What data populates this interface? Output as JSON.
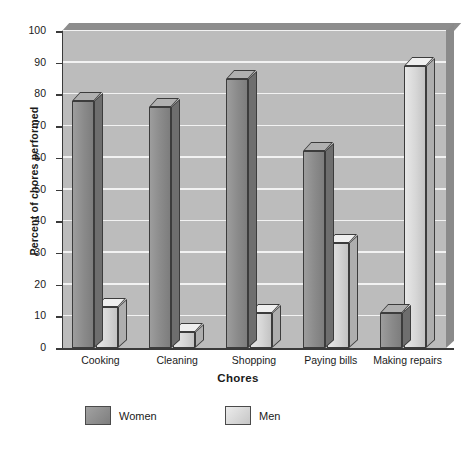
{
  "chart_data": {
    "type": "bar",
    "title": "",
    "xlabel": "Chores",
    "ylabel": "Percent of chores performed",
    "categories": [
      "Cooking",
      "Cleaning",
      "Shopping",
      "Paying bills",
      "Making repairs"
    ],
    "series": [
      {
        "name": "Women",
        "values": [
          78,
          76,
          85,
          62,
          11
        ],
        "color": "#8a8a8a"
      },
      {
        "name": "Men",
        "values": [
          13,
          5,
          11,
          33,
          89
        ],
        "color": "#d6d6d6"
      }
    ],
    "ylim": [
      0,
      100
    ],
    "yticks": [
      0,
      10,
      20,
      30,
      40,
      50,
      60,
      70,
      80,
      90,
      100
    ],
    "ytick_labels": [
      "0",
      "10",
      "20",
      "30",
      "40",
      "50",
      "60",
      "70",
      "80",
      "90",
      "100"
    ],
    "grid": true,
    "grid_color": "#f2f2f2",
    "plot_background": "#bcbcbc",
    "legend_position": "bottom",
    "style": "3d-bars-grayscale"
  },
  "legend": {
    "items": [
      {
        "label": "Women",
        "swatch": "women-swatch"
      },
      {
        "label": "Men",
        "swatch": "men-swatch"
      }
    ]
  },
  "axis": {
    "y_title": "Percent of chores performed",
    "x_title": "Chores"
  }
}
